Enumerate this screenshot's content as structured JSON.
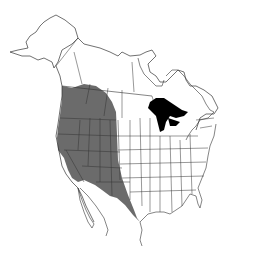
{
  "map": {
    "type": "species-range-map",
    "region": "North America",
    "colors": {
      "background": "#ffffff",
      "outline": "#333333",
      "range_fill": "#6b6b6b",
      "great_lakes": "#000000"
    },
    "legend": null
  }
}
